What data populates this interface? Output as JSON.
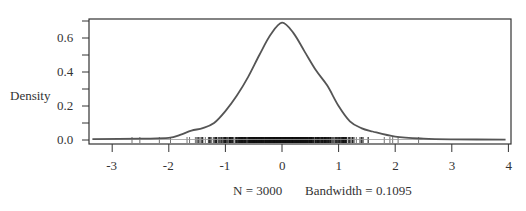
{
  "chart_data": {
    "type": "line",
    "subtype": "density",
    "title": "",
    "xlabel": "N = 3000   Bandwidth = 0.1095",
    "ylabel": "Density",
    "xlim": [
      -3.4,
      4.0
    ],
    "ylim": [
      0,
      0.72
    ],
    "x_ticks": [
      "-3",
      "-2",
      "-1",
      "0",
      "1",
      "2",
      "3",
      "4"
    ],
    "y_ticks": [
      "0.0",
      "0.2",
      "0.4",
      "0.6"
    ],
    "grid": false,
    "legend": null,
    "rug": true,
    "series": [
      {
        "name": "density",
        "x": [
          -3.35,
          -2.5,
          -2.0,
          -1.8,
          -1.6,
          -1.4,
          -1.2,
          -1.0,
          -0.8,
          -0.6,
          -0.4,
          -0.2,
          0.0,
          0.2,
          0.4,
          0.6,
          0.8,
          1.0,
          1.2,
          1.4,
          1.6,
          2.0,
          2.5,
          3.0,
          3.95
        ],
        "values": [
          0.005,
          0.008,
          0.012,
          0.03,
          0.055,
          0.07,
          0.1,
          0.17,
          0.26,
          0.37,
          0.5,
          0.62,
          0.69,
          0.63,
          0.52,
          0.41,
          0.32,
          0.2,
          0.11,
          0.07,
          0.05,
          0.02,
          0.008,
          0.004,
          0.002
        ]
      }
    ],
    "sample_size": 3000,
    "bandwidth": 0.1095
  },
  "labels": {
    "ylabel": "Density",
    "footer_n": "N = 3000",
    "footer_bw": "Bandwidth = 0.1095",
    "x_ticks": [
      "-3",
      "-2",
      "-1",
      "0",
      "1",
      "2",
      "3",
      "4"
    ],
    "y_ticks": [
      "0.0",
      "0.2",
      "0.4",
      "0.6"
    ]
  },
  "colors": {
    "curve": "#555555",
    "axis": "#333333",
    "rug": "#111111"
  }
}
